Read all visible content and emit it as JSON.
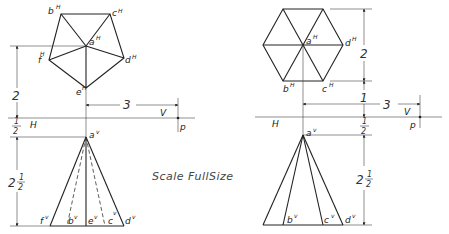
{
  "caption": {
    "scale_label": "Scale FullSize"
  },
  "left_figure": {
    "name": "pentagonal pyramid",
    "top_view_labels": {
      "b": "b",
      "c": "c",
      "a": "a",
      "f": "f",
      "d": "d",
      "e": "e",
      "sup": "H"
    },
    "front_view_labels": {
      "a": "a",
      "f": "f",
      "b": "b",
      "e": "e",
      "c": "c",
      "d": "d",
      "sup": "v"
    },
    "dimensions": {
      "top_offset": "2",
      "gap_whole": "1",
      "gap_num": "1",
      "gap_den": "2",
      "height_whole": "2",
      "height_num": "1",
      "height_den": "2",
      "horizontal": "3"
    },
    "plane_labels": {
      "H": "H",
      "V": "V",
      "p": "p"
    }
  },
  "right_figure": {
    "name": "hexagonal pyramid",
    "top_view_labels": {
      "a": "a",
      "d": "d",
      "b": "b",
      "c": "c",
      "sup": "H"
    },
    "front_view_labels": {
      "a": "a",
      "b": "b",
      "c": "c",
      "d": "d",
      "sup": "v"
    },
    "dimensions": {
      "top_size": "2",
      "top_offset": "1",
      "gap_num": "1",
      "gap_den": "2",
      "height_whole": "2",
      "height_num": "1",
      "height_den": "2",
      "horizontal": "3"
    },
    "plane_labels": {
      "H": "H",
      "V": "V",
      "p": "p"
    }
  }
}
